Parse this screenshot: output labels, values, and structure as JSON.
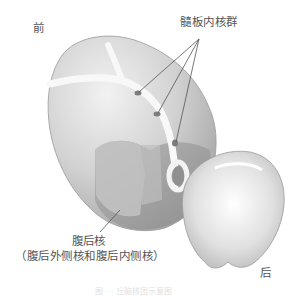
{
  "figure": {
    "labels": {
      "anterior": "前",
      "intralaminar_nuclei": "髓板内核群",
      "ventral_posterior_nucleus": "腹后核",
      "ventral_posterior_detail": "（腹后外侧核和腹后内侧核）",
      "posterior": "后"
    },
    "caption_partial": "图 ··· 丘脑核团示意图"
  },
  "colors": {
    "background": "#ffffff",
    "body_light": "#e8e8e8",
    "body_mid": "#c9c9c9",
    "body_dark": "#9e9e9e",
    "lamina": "#f7f7f7",
    "leader_line": "#555555",
    "label_text": "#555555"
  }
}
